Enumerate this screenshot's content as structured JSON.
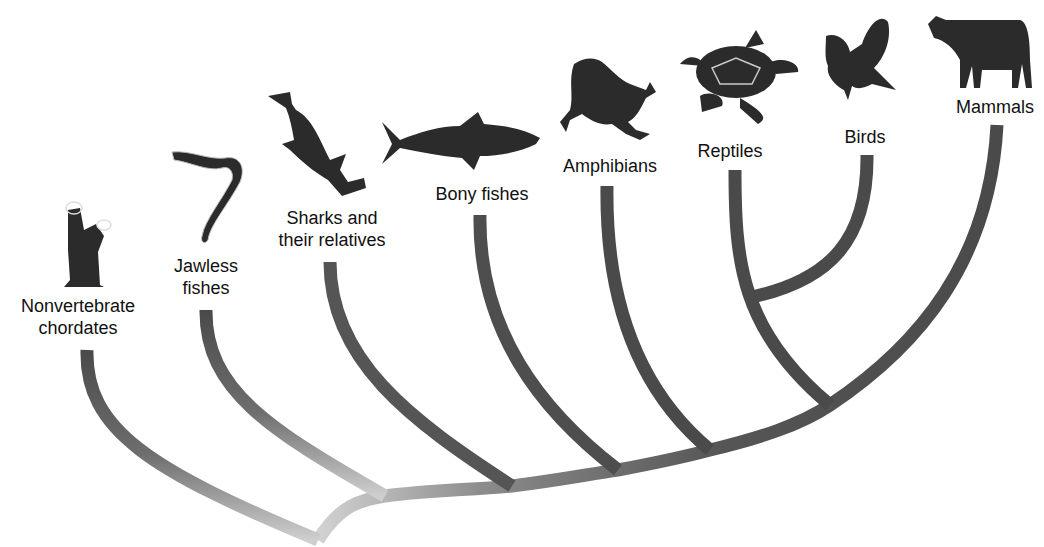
{
  "diagram": {
    "type": "cladogram",
    "branch_color": "#4a4a4a",
    "root_color": "#c8c8c8",
    "taxa": [
      {
        "id": "nonvertebrate",
        "label_line1": "Nonvertebrate",
        "label_line2": "chordates",
        "icon": "tunicate-icon"
      },
      {
        "id": "jawless",
        "label_line1": "Jawless",
        "label_line2": "fishes",
        "icon": "lamprey-icon"
      },
      {
        "id": "sharks",
        "label_line1": "Sharks and",
        "label_line2": "their relatives",
        "icon": "hammerhead-shark-icon"
      },
      {
        "id": "bony",
        "label_line1": "Bony fishes",
        "label_line2": "",
        "icon": "tuna-icon"
      },
      {
        "id": "amphibians",
        "label_line1": "Amphibians",
        "label_line2": "",
        "icon": "frog-icon"
      },
      {
        "id": "reptiles",
        "label_line1": "Reptiles",
        "label_line2": "",
        "icon": "turtle-icon"
      },
      {
        "id": "birds",
        "label_line1": "Birds",
        "label_line2": "",
        "icon": "bird-icon"
      },
      {
        "id": "mammals",
        "label_line1": "Mammals",
        "label_line2": "",
        "icon": "cow-icon"
      }
    ]
  }
}
